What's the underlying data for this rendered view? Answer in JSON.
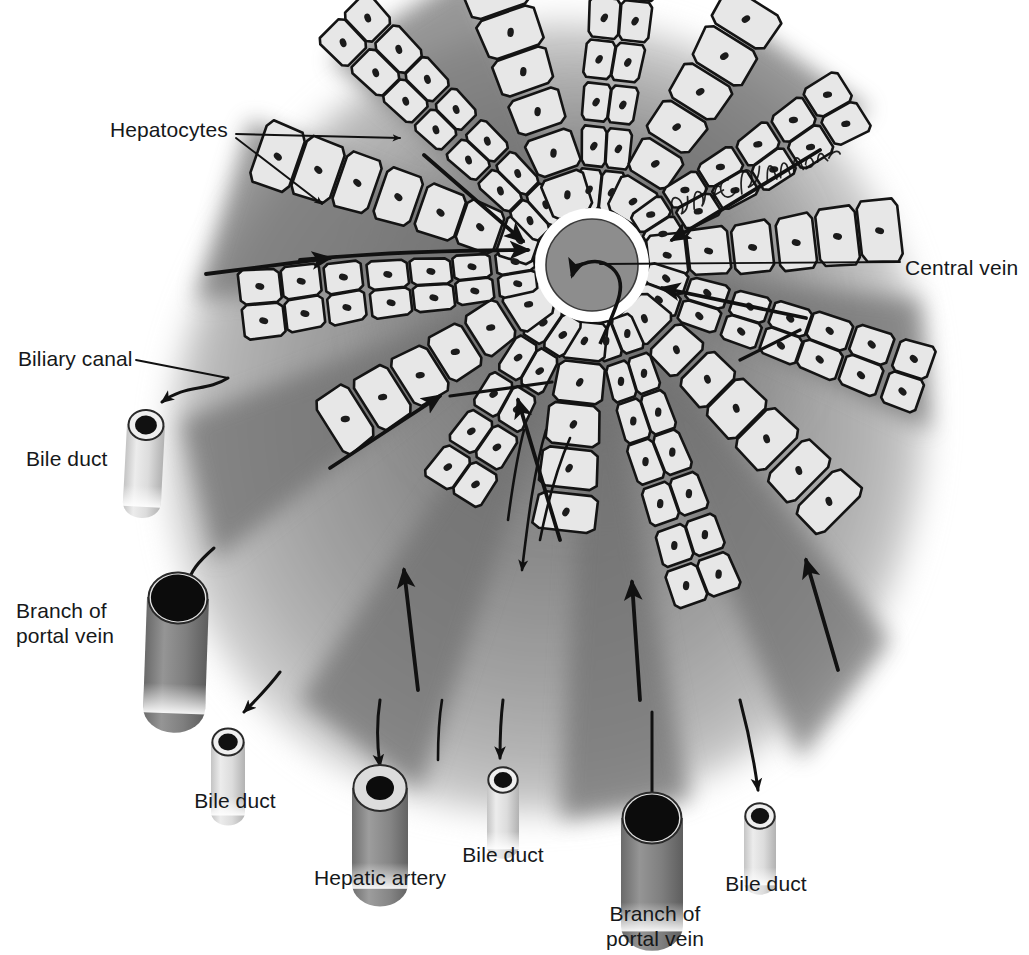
{
  "figure": {
    "signature": "David E. Christensen",
    "palette": {
      "background": "#ffffff",
      "lobule_light": "#c9c9c9",
      "lobule_mid": "#9a9a9a",
      "lobule_dark": "#6f6f6f",
      "sinusoid_dark": "#6b6b6b",
      "cell_fill": "#e6e6e6",
      "cell_outline": "#1a1a1a",
      "nucleus": "#1c1c1c",
      "central_vein_fill": "#8f8f8f",
      "central_vein_ring": "#ffffff",
      "bile_duct_wall": "#d8d8d8",
      "bile_duct_lumen": "#101010",
      "portal_vein_wall": "#8a8a8a",
      "portal_vein_lumen": "#0d0d0d",
      "artery_wall": "#d2d2d2",
      "artery_lumen": "#0d0d0d",
      "leader_line": "#111111"
    }
  },
  "labels": [
    {
      "id": "hepatocytes",
      "text": "Hepatocytes",
      "x": 110,
      "y": 118,
      "align": "left"
    },
    {
      "id": "central-vein",
      "text": "Central vein",
      "x": 905,
      "y": 256,
      "align": "left"
    },
    {
      "id": "biliary-canal",
      "text": "Biliary canal",
      "x": 18,
      "y": 347,
      "align": "left"
    },
    {
      "id": "bile-duct-left",
      "text": "Bile duct",
      "x": 26,
      "y": 447,
      "align": "left"
    },
    {
      "id": "branch-portal-left",
      "text": "Branch of\nportal vein",
      "x": 16,
      "y": 599,
      "align": "left"
    },
    {
      "id": "bile-duct-lower",
      "text": "Bile duct",
      "x": 235,
      "y": 789,
      "align": "center"
    },
    {
      "id": "hepatic-artery",
      "text": "Hepatic artery",
      "x": 380,
      "y": 866,
      "align": "center"
    },
    {
      "id": "bile-duct-mid",
      "text": "Bile duct",
      "x": 503,
      "y": 843,
      "align": "center"
    },
    {
      "id": "branch-portal-bottom",
      "text": "Branch of\nportal vein",
      "x": 655,
      "y": 902,
      "align": "center"
    },
    {
      "id": "bile-duct-right",
      "text": "Bile duct",
      "x": 766,
      "y": 872,
      "align": "center"
    }
  ],
  "structures": {
    "central_vein": {
      "cx": 592,
      "cy": 265,
      "r_outer": 57,
      "r_ring": 49,
      "r_inner": 45
    },
    "lobule": {
      "cx": 560,
      "cy": 400,
      "rx": 360,
      "ry": 385
    },
    "vessels": [
      {
        "id": "bile-duct-left",
        "type": "bile-duct",
        "x": 146,
        "y": 425,
        "w": 38,
        "h": 78,
        "tilt": 3
      },
      {
        "id": "branch-portal-left",
        "type": "portal-vein",
        "x": 178,
        "y": 598,
        "w": 62,
        "h": 110,
        "tilt": 2
      },
      {
        "id": "bile-duct-lower",
        "type": "bile-duct",
        "x": 228,
        "y": 742,
        "w": 34,
        "h": 70,
        "tilt": 0
      },
      {
        "id": "hepatic-artery",
        "type": "hepatic-artery",
        "x": 380,
        "y": 788,
        "w": 56,
        "h": 96,
        "tilt": 0
      },
      {
        "id": "bile-duct-mid",
        "type": "bile-duct",
        "x": 503,
        "y": 780,
        "w": 32,
        "h": 66,
        "tilt": 0
      },
      {
        "id": "branch-portal-bottom",
        "type": "portal-vein",
        "x": 652,
        "y": 818,
        "w": 62,
        "h": 108,
        "tilt": 0
      },
      {
        "id": "bile-duct-right",
        "type": "bile-duct",
        "x": 760,
        "y": 816,
        "w": 32,
        "h": 66,
        "tilt": 0
      }
    ],
    "cell_cords_count": 14,
    "flow_arrows_count": 9,
    "bile_canaliculi_arrows_count": 6
  }
}
